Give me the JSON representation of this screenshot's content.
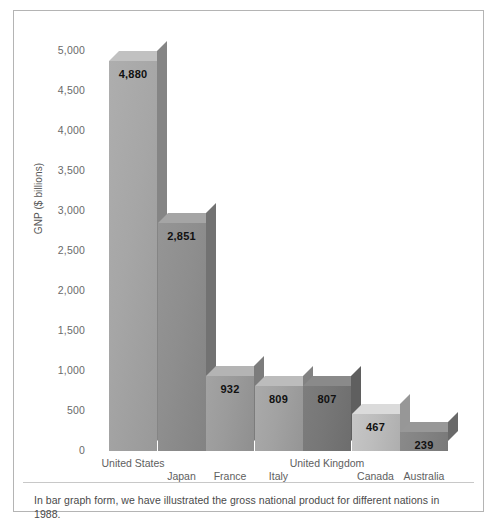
{
  "chart_data": {
    "type": "bar",
    "title": "",
    "xlabel": "",
    "ylabel": "GNP ($ billions)",
    "ylim": [
      0,
      5000
    ],
    "grid": false,
    "legend": "none",
    "categories": [
      "United States",
      "Japan",
      "France",
      "Italy",
      "United Kingdom",
      "Canada",
      "Australia"
    ],
    "values": [
      4880,
      2851,
      932,
      809,
      807,
      467,
      239
    ],
    "value_labels": [
      "4,880",
      "2,851",
      "932",
      "809",
      "807",
      "467",
      "239"
    ],
    "y_ticks": [
      0,
      500,
      1000,
      1500,
      2000,
      2500,
      3000,
      3500,
      4000,
      4500,
      5000
    ],
    "y_tick_labels": [
      "0",
      "500",
      "1,000",
      "1,500",
      "2,000",
      "2,500",
      "3,000",
      "3,500",
      "4,000",
      "4,500",
      "5,000"
    ],
    "bar_colors": [
      "#a6a6a6",
      "#8e8e8e",
      "#9b9b9b",
      "#a2a2a2",
      "#777777",
      "#bdbdbd",
      "#838383"
    ]
  },
  "caption": {
    "text": "In bar graph form, we have illustrated the gross national product for different nations in 1988."
  }
}
